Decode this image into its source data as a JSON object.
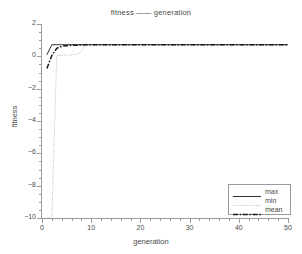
{
  "chart_data": {
    "type": "line",
    "title": "fitness —— generation",
    "xlabel": "generation",
    "ylabel": "fitness",
    "xlim": [
      0,
      50
    ],
    "ylim": [
      -10,
      2
    ],
    "xticks": [
      0,
      10,
      20,
      30,
      40,
      50
    ],
    "yticks": [
      2,
      0,
      -2,
      -4,
      -6,
      -8,
      -10
    ],
    "grid": false,
    "legend_position": "lower right",
    "x": [
      1,
      2,
      3,
      4,
      5,
      6,
      7,
      8,
      9,
      10,
      12,
      14,
      16,
      18,
      20,
      25,
      30,
      35,
      40,
      45,
      50
    ],
    "series": [
      {
        "name": "max",
        "style": "solid",
        "color": "#1a1a1a",
        "values": [
          0.1,
          0.72,
          0.72,
          0.72,
          0.72,
          0.72,
          0.72,
          0.72,
          0.72,
          0.72,
          0.72,
          0.72,
          0.72,
          0.72,
          0.72,
          0.72,
          0.72,
          0.72,
          0.72,
          0.72,
          0.72
        ]
      },
      {
        "name": "min",
        "style": "dotted",
        "color": "#8a8a8a",
        "values": [
          -10.0,
          -10.0,
          0.05,
          0.05,
          0.08,
          0.1,
          0.12,
          0.3,
          0.72,
          0.72,
          0.72,
          0.72,
          0.72,
          0.72,
          0.72,
          0.72,
          0.72,
          0.72,
          0.72,
          0.72,
          0.72
        ]
      },
      {
        "name": "mean",
        "style": "dashdot",
        "color": "#1a1a1a",
        "values": [
          -0.75,
          0.05,
          0.5,
          0.62,
          0.66,
          0.68,
          0.69,
          0.7,
          0.72,
          0.72,
          0.72,
          0.72,
          0.72,
          0.72,
          0.72,
          0.72,
          0.72,
          0.72,
          0.72,
          0.72,
          0.72
        ]
      }
    ],
    "legend": [
      {
        "label": "max",
        "style": "solid"
      },
      {
        "label": "min",
        "style": "dotted"
      },
      {
        "label": "mean",
        "style": "dashdot"
      }
    ]
  }
}
